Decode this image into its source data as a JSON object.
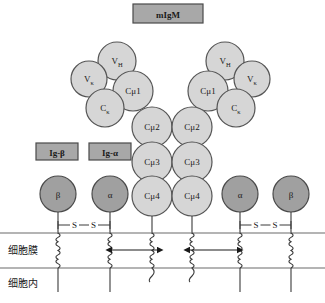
{
  "figure": {
    "title_box": {
      "label": "mIgM",
      "fill": "#a8a8a8",
      "stroke": "#4a4a4a"
    },
    "accessory_boxes": [
      {
        "name": "ig-beta",
        "label": "Ig-β",
        "fill": "#a8a8a8",
        "stroke": "#4a4a4a"
      },
      {
        "name": "ig-alpha",
        "label": "Ig-α",
        "fill": "#a8a8a8",
        "stroke": "#4a4a4a"
      }
    ],
    "colors": {
      "domain_fill": "#d6d6d6",
      "domain_stroke": "#555555",
      "accessory_fill": "#a0a0a0",
      "accessory_stroke": "#4a4a4a",
      "line": "#3a3a3a",
      "membrane_line": "#6a6a6a",
      "text": "#1a1a1a"
    },
    "antibody_domains": [
      {
        "name": "left-vh",
        "label": "V",
        "sub": "H",
        "cx": 117,
        "cy": 61,
        "r": 19
      },
      {
        "name": "left-vk",
        "label": "V",
        "sub": "κ",
        "cx": 89,
        "cy": 79,
        "r": 18
      },
      {
        "name": "left-cmu1",
        "label": "Cμ1",
        "sub": "",
        "cx": 133,
        "cy": 91,
        "r": 20
      },
      {
        "name": "left-ck",
        "label": "C",
        "sub": "κ",
        "cx": 105,
        "cy": 108,
        "r": 19
      },
      {
        "name": "right-vh",
        "label": "V",
        "sub": "H",
        "cx": 225,
        "cy": 61,
        "r": 19
      },
      {
        "name": "right-vk",
        "label": "V",
        "sub": "κ",
        "cx": 252,
        "cy": 79,
        "r": 18
      },
      {
        "name": "right-cmu1",
        "label": "Cμ1",
        "sub": "",
        "cx": 208,
        "cy": 91,
        "r": 20
      },
      {
        "name": "right-ck",
        "label": "C",
        "sub": "κ",
        "cx": 236,
        "cy": 108,
        "r": 19
      },
      {
        "name": "left-cmu2",
        "label": "Cμ2",
        "sub": "",
        "cx": 152,
        "cy": 127,
        "r": 20
      },
      {
        "name": "right-cmu2",
        "label": "Cμ2",
        "sub": "",
        "cx": 192,
        "cy": 127,
        "r": 20
      },
      {
        "name": "left-cmu3",
        "label": "Cμ3",
        "sub": "",
        "cx": 152,
        "cy": 162,
        "r": 20
      },
      {
        "name": "right-cmu3",
        "label": "Cμ3",
        "sub": "",
        "cx": 192,
        "cy": 162,
        "r": 20
      },
      {
        "name": "left-cmu4",
        "label": "Cμ4",
        "sub": "",
        "cx": 152,
        "cy": 196,
        "r": 20
      },
      {
        "name": "right-cmu4",
        "label": "Cμ4",
        "sub": "",
        "cx": 192,
        "cy": 196,
        "r": 20
      }
    ],
    "accessory_chains": [
      {
        "name": "beta-left",
        "label": "β",
        "cx": 58,
        "cy": 194,
        "r": 18
      },
      {
        "name": "alpha-left",
        "label": "α",
        "cx": 110,
        "cy": 194,
        "r": 18
      },
      {
        "name": "alpha-right",
        "label": "α",
        "cx": 240,
        "cy": 194,
        "r": 18
      },
      {
        "name": "beta-right",
        "label": "β",
        "cx": 291,
        "cy": 194,
        "r": 18
      }
    ],
    "disulfide_bonds": [
      {
        "name": "ss-left",
        "label_a": "S",
        "label_b": "S",
        "x1": 58,
        "x2": 110,
        "y": 225
      },
      {
        "name": "ss-right",
        "label_a": "S",
        "label_b": "S",
        "x1": 240,
        "x2": 291,
        "y": 225
      }
    ],
    "membrane": {
      "top_y": 233,
      "bottom_y": 268,
      "label_membrane": "细胞膜",
      "label_intracellular": "细胞内"
    },
    "arrows": [
      {
        "name": "association-arrow-left",
        "x1": 112,
        "x2": 158,
        "y": 250
      },
      {
        "name": "association-arrow-right",
        "x1": 190,
        "x2": 238,
        "y": 250
      }
    ],
    "caption": ""
  }
}
